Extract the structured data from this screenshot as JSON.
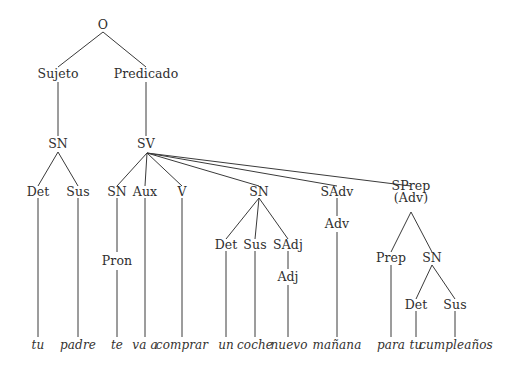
{
  "diagram": {
    "background_color": "#ffffff",
    "line_color": "#3a3a3a",
    "text_color": "#2e2e2e",
    "sentence": "tu padre te va a comprar un coche nuevo mañana para tu cumpleaños"
  },
  "nodes": {
    "o": "O",
    "sujeto": "Sujeto",
    "predicado": "Predicado",
    "sn_subject": "SN",
    "sv": "SV",
    "det_subject": "Det",
    "sus_subject": "Sus",
    "sn_pron": "SN",
    "aux": "Aux",
    "v": "V",
    "sn_object": "SN",
    "sadv": "SAdv",
    "sprep": "SPrep",
    "sprep_sub": "(Adv)",
    "pron": "Pron",
    "det_object": "Det",
    "sus_object": "Sus",
    "sadj": "SAdj",
    "adj": "Adj",
    "adv": "Adv",
    "prep": "Prep",
    "sn_prep": "SN",
    "det_prep": "Det",
    "sus_prep": "Sus"
  },
  "leaves": {
    "tu_1": "tu",
    "padre": "padre",
    "te": "te",
    "va_a": "va a",
    "comprar": "comprar",
    "un": "un",
    "coche": "coche",
    "nuevo": "nuevo",
    "manana": "mañana",
    "para": "para",
    "tu_2": "tu",
    "cumpleanos": "cumpleaños"
  }
}
